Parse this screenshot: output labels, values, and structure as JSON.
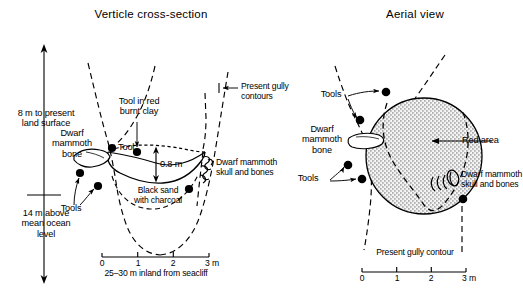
{
  "figure": {
    "panels": [
      {
        "id": "vertical-cross-section",
        "title": "Verticle cross-section",
        "labels": {
          "elevation_top": "8 m to present\nland surface",
          "elevation_bottom": "14 m above\nmean ocean\nlevel",
          "dwarf_mammoth_bone": "Dwarf\nmammoth\nbone",
          "tools_left": "Tools",
          "tool_point": "Tool",
          "tool_in_red_burnt_clay": "Tool in red\nburnt clay",
          "depth": "0.8 m",
          "black_sand": "Black sand\nwith charcoal",
          "skull_and_bones": "Dwarf mammoth\nskull and bones",
          "present_gully_contours": "Present gully\ncontours",
          "scale_caption": "25–30 m inland from seacliff"
        },
        "scale": {
          "ticks": [
            "0",
            "1",
            "2",
            "3 m"
          ],
          "unit": "m",
          "max": 3
        }
      },
      {
        "id": "aerial-view",
        "title": "Aerial view",
        "labels": {
          "tools_upper": "Tools",
          "tools_lower": "Tools",
          "dwarf_mammoth_bone": "Dwarf\nmammoth\nbone",
          "red_area": "Red area",
          "skull_and_bones": "Dwarf mammoth\nskull and bones",
          "present_gully_contour": "Present gully contour"
        },
        "scale": {
          "ticks": [
            "0",
            "1",
            "2",
            "3 m"
          ],
          "unit": "m",
          "max": 3
        }
      }
    ],
    "colors": {
      "ink": "#000000",
      "background": "#ffffff",
      "red_area_fill": "#c9c9c9"
    }
  }
}
